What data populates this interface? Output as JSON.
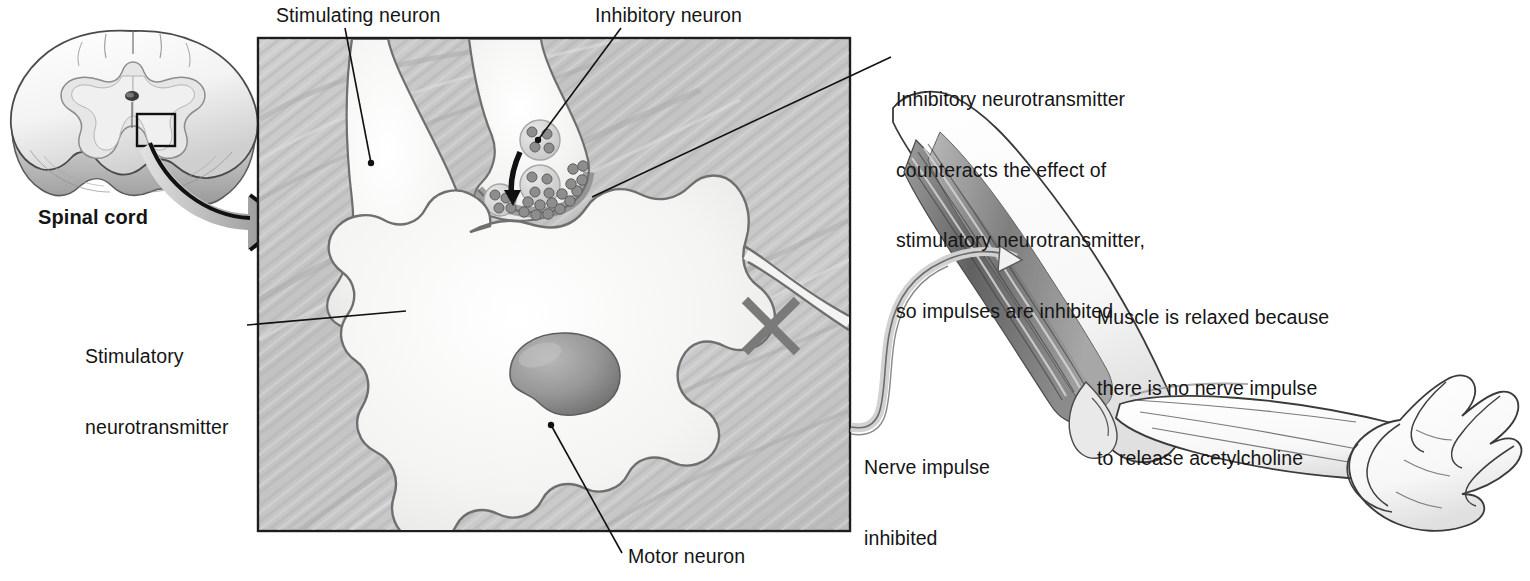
{
  "figure": {
    "type": "anatomical-illustration"
  },
  "labels": {
    "spinal_cord": "Spinal cord",
    "stimulating_neuron": "Stimulating neuron",
    "inhibitory_neuron": "Inhibitory neuron",
    "inhibitory_neurotransmitter": "Inhibitory neurotransmitter\ncounteracts the effect of\nstimulatory neurotransmitter,\nso impulses are inhibited",
    "inhibitory_neurotransmitter_lines": [
      "Inhibitory neurotransmitter",
      "counteracts the effect of",
      "stimulatory neurotransmitter,",
      "so impulses are inhibited"
    ],
    "stimulatory_neurotransmitter_lines": [
      "Stimulatory",
      "neurotransmitter"
    ],
    "motor_neuron": "Motor neuron",
    "nerve_impulse_inhibited_lines": [
      "Nerve impulse",
      "inhibited"
    ],
    "muscle_relaxed_lines": [
      "Muscle is relaxed because",
      "there is no nerve impulse",
      "to release acetylcholine"
    ]
  },
  "icons": {
    "blocked_impulse": "x-cross-icon",
    "magnify_arrow": "curved-arrow-icon",
    "vesicle_release_arrow": "curved-arrow-icon",
    "roi_box": "region-of-interest-box-icon"
  },
  "colors": {
    "text": "#151515",
    "panel_border": "#1d1d1d",
    "panel_background": "#c9c9c9",
    "cell_fill": "#f2f2f0",
    "cell_outline": "#6f6f6f",
    "nucleus": "#8d8d8d",
    "vesicle": "#9a9a9a",
    "x_mark": "#7a7a7a",
    "leader_line": "#111111",
    "arrow_gray": "#a8a8a8",
    "muscle_dark": "#5d5d5d",
    "muscle_mid": "#8f8f8f",
    "muscle_light": "#d5d5d5",
    "skin_outline": "#3a3a3a"
  },
  "panel": {
    "x": 258,
    "y": 38,
    "width": 592,
    "height": 493
  }
}
